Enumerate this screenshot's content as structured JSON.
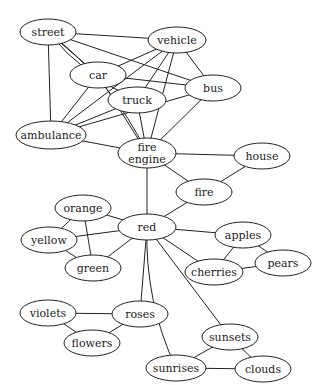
{
  "diagram": {
    "type": "undirected-graph",
    "colors": {
      "stroke": "#222222",
      "fill": "#ffffff",
      "text": "#222222"
    },
    "nodes": [
      {
        "id": "street",
        "label": [
          "street"
        ],
        "x": 48,
        "y": 32,
        "rx": 28,
        "ry": 13
      },
      {
        "id": "vehicle",
        "label": [
          "vehicle"
        ],
        "x": 177,
        "y": 40,
        "rx": 29,
        "ry": 13
      },
      {
        "id": "car",
        "label": [
          "car"
        ],
        "x": 98,
        "y": 75,
        "rx": 28,
        "ry": 13
      },
      {
        "id": "bus",
        "label": [
          "bus"
        ],
        "x": 213,
        "y": 88,
        "rx": 28,
        "ry": 13
      },
      {
        "id": "truck",
        "label": [
          "truck"
        ],
        "x": 137,
        "y": 100,
        "rx": 29,
        "ry": 13
      },
      {
        "id": "ambulance",
        "label": [
          "ambulance"
        ],
        "x": 51,
        "y": 135,
        "rx": 35,
        "ry": 14
      },
      {
        "id": "fire_engine",
        "label": [
          "fire",
          "engine"
        ],
        "x": 147,
        "y": 153,
        "rx": 29,
        "ry": 15
      },
      {
        "id": "house",
        "label": [
          "house"
        ],
        "x": 262,
        "y": 156,
        "rx": 28,
        "ry": 13
      },
      {
        "id": "fire",
        "label": [
          "fire"
        ],
        "x": 204,
        "y": 192,
        "rx": 28,
        "ry": 13
      },
      {
        "id": "orange",
        "label": [
          "orange"
        ],
        "x": 83,
        "y": 208,
        "rx": 28,
        "ry": 13
      },
      {
        "id": "red",
        "label": [
          "red"
        ],
        "x": 147,
        "y": 227,
        "rx": 29,
        "ry": 13
      },
      {
        "id": "yellow",
        "label": [
          "yellow"
        ],
        "x": 49,
        "y": 240,
        "rx": 28,
        "ry": 13
      },
      {
        "id": "apples",
        "label": [
          "apples"
        ],
        "x": 243,
        "y": 235,
        "rx": 28,
        "ry": 13
      },
      {
        "id": "green",
        "label": [
          "green"
        ],
        "x": 93,
        "y": 268,
        "rx": 28,
        "ry": 13
      },
      {
        "id": "cherries",
        "label": [
          "cherries"
        ],
        "x": 214,
        "y": 272,
        "rx": 29,
        "ry": 13
      },
      {
        "id": "pears",
        "label": [
          "pears"
        ],
        "x": 283,
        "y": 263,
        "rx": 28,
        "ry": 13
      },
      {
        "id": "violets",
        "label": [
          "violets"
        ],
        "x": 48,
        "y": 313,
        "rx": 28,
        "ry": 13
      },
      {
        "id": "roses",
        "label": [
          "roses"
        ],
        "x": 140,
        "y": 314,
        "rx": 28,
        "ry": 13
      },
      {
        "id": "flowers",
        "label": [
          "flowers"
        ],
        "x": 92,
        "y": 343,
        "rx": 28,
        "ry": 13
      },
      {
        "id": "sunsets",
        "label": [
          "sunsets"
        ],
        "x": 230,
        "y": 337,
        "rx": 28,
        "ry": 13
      },
      {
        "id": "sunrises",
        "label": [
          "sunrises"
        ],
        "x": 176,
        "y": 368,
        "rx": 30,
        "ry": 13
      },
      {
        "id": "clouds",
        "label": [
          "clouds"
        ],
        "x": 263,
        "y": 369,
        "rx": 28,
        "ry": 13
      }
    ],
    "edges": [
      {
        "from": "street",
        "to": "vehicle"
      },
      {
        "from": "street",
        "to": "car"
      },
      {
        "from": "street",
        "to": "truck",
        "curve": 1
      },
      {
        "from": "street",
        "to": "bus"
      },
      {
        "from": "street",
        "to": "ambulance"
      },
      {
        "from": "street",
        "to": "fire_engine",
        "curve": -1
      },
      {
        "from": "vehicle",
        "to": "car"
      },
      {
        "from": "vehicle",
        "to": "truck"
      },
      {
        "from": "vehicle",
        "to": "bus"
      },
      {
        "from": "vehicle",
        "to": "ambulance"
      },
      {
        "from": "vehicle",
        "to": "fire_engine"
      },
      {
        "from": "car",
        "to": "bus"
      },
      {
        "from": "car",
        "to": "ambulance"
      },
      {
        "from": "car",
        "to": "fire_engine"
      },
      {
        "from": "truck",
        "to": "ambulance"
      },
      {
        "from": "truck",
        "to": "fire_engine"
      },
      {
        "from": "bus",
        "to": "ambulance"
      },
      {
        "from": "bus",
        "to": "fire_engine"
      },
      {
        "from": "ambulance",
        "to": "fire_engine"
      },
      {
        "from": "fire_engine",
        "to": "house"
      },
      {
        "from": "fire_engine",
        "to": "fire"
      },
      {
        "from": "fire_engine",
        "to": "red"
      },
      {
        "from": "house",
        "to": "fire"
      },
      {
        "from": "fire",
        "to": "red"
      },
      {
        "from": "orange",
        "to": "red"
      },
      {
        "from": "orange",
        "to": "yellow"
      },
      {
        "from": "orange",
        "to": "green"
      },
      {
        "from": "yellow",
        "to": "red"
      },
      {
        "from": "yellow",
        "to": "green"
      },
      {
        "from": "green",
        "to": "red"
      },
      {
        "from": "red",
        "to": "apples"
      },
      {
        "from": "red",
        "to": "cherries"
      },
      {
        "from": "red",
        "to": "roses"
      },
      {
        "from": "red",
        "to": "sunsets"
      },
      {
        "from": "red",
        "to": "sunrises",
        "curve": 1
      },
      {
        "from": "apples",
        "to": "cherries"
      },
      {
        "from": "apples",
        "to": "pears"
      },
      {
        "from": "cherries",
        "to": "pears"
      },
      {
        "from": "violets",
        "to": "roses"
      },
      {
        "from": "violets",
        "to": "flowers"
      },
      {
        "from": "roses",
        "to": "flowers"
      },
      {
        "from": "sunsets",
        "to": "sunrises"
      },
      {
        "from": "sunsets",
        "to": "clouds"
      },
      {
        "from": "sunrises",
        "to": "clouds"
      }
    ]
  }
}
